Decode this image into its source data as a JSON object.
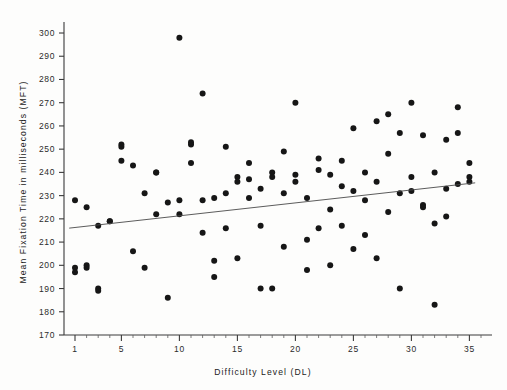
{
  "chart_data": {
    "type": "scatter",
    "title": "",
    "xlabel": "Difficulty Level (DL)",
    "ylabel": "Mean Fixation Time in milliseconds (MFT)",
    "xlim": [
      0.4,
      36.2
    ],
    "ylim": [
      170,
      303
    ],
    "xticks": [
      1,
      5,
      10,
      15,
      20,
      25,
      30,
      35
    ],
    "xtick_labels": [
      "1",
      "5",
      "10",
      "15",
      "20",
      "25",
      "30",
      "35"
    ],
    "xminor_step": 1,
    "yticks": [
      170,
      180,
      190,
      200,
      210,
      220,
      230,
      240,
      250,
      260,
      270,
      280,
      290,
      300
    ],
    "ytick_labels": [
      "170",
      "180",
      "190",
      "200",
      "210",
      "220",
      "230",
      "240",
      "250",
      "260",
      "270",
      "280",
      "290",
      "300"
    ],
    "grid": false,
    "legend": null,
    "marker": "filled-circle",
    "marker_color": "#161616",
    "marker_size": 3.0,
    "points": [
      [
        1,
        228
      ],
      [
        1,
        199
      ],
      [
        1,
        197
      ],
      [
        2,
        225
      ],
      [
        2,
        199
      ],
      [
        2,
        200
      ],
      [
        3,
        217
      ],
      [
        3,
        190
      ],
      [
        3,
        189
      ],
      [
        4,
        219
      ],
      [
        4,
        219
      ],
      [
        5,
        251
      ],
      [
        5,
        252
      ],
      [
        5,
        245
      ],
      [
        6,
        243
      ],
      [
        6,
        206
      ],
      [
        7,
        199
      ],
      [
        7,
        231
      ],
      [
        8,
        222
      ],
      [
        8,
        240
      ],
      [
        8,
        240
      ],
      [
        9,
        227
      ],
      [
        9,
        186
      ],
      [
        10,
        298
      ],
      [
        10,
        222
      ],
      [
        10,
        228
      ],
      [
        11,
        252
      ],
      [
        11,
        253
      ],
      [
        11,
        244
      ],
      [
        12,
        274
      ],
      [
        12,
        228
      ],
      [
        12,
        214
      ],
      [
        13,
        229
      ],
      [
        13,
        202
      ],
      [
        13,
        195
      ],
      [
        14,
        251
      ],
      [
        14,
        216
      ],
      [
        14,
        231
      ],
      [
        15,
        238
      ],
      [
        15,
        236
      ],
      [
        15,
        203
      ],
      [
        16,
        244
      ],
      [
        16,
        237
      ],
      [
        16,
        229
      ],
      [
        17,
        233
      ],
      [
        17,
        217
      ],
      [
        17,
        190
      ],
      [
        18,
        240
      ],
      [
        18,
        238
      ],
      [
        18,
        190
      ],
      [
        19,
        249
      ],
      [
        19,
        231
      ],
      [
        19,
        208
      ],
      [
        20,
        270
      ],
      [
        20,
        236
      ],
      [
        20,
        239
      ],
      [
        21,
        229
      ],
      [
        21,
        211
      ],
      [
        21,
        198
      ],
      [
        22,
        241
      ],
      [
        22,
        246
      ],
      [
        22,
        216
      ],
      [
        23,
        224
      ],
      [
        23,
        239
      ],
      [
        23,
        200
      ],
      [
        24,
        234
      ],
      [
        24,
        245
      ],
      [
        24,
        217
      ],
      [
        25,
        259
      ],
      [
        25,
        232
      ],
      [
        25,
        207
      ],
      [
        26,
        240
      ],
      [
        26,
        228
      ],
      [
        26,
        213
      ],
      [
        27,
        262
      ],
      [
        27,
        236
      ],
      [
        27,
        203
      ],
      [
        28,
        265
      ],
      [
        28,
        248
      ],
      [
        28,
        223
      ],
      [
        29,
        257
      ],
      [
        29,
        231
      ],
      [
        29,
        190
      ],
      [
        30,
        270
      ],
      [
        30,
        238
      ],
      [
        30,
        232
      ],
      [
        31,
        256
      ],
      [
        31,
        226
      ],
      [
        31,
        225
      ],
      [
        32,
        240
      ],
      [
        32,
        218
      ],
      [
        32,
        183
      ],
      [
        33,
        254
      ],
      [
        33,
        233
      ],
      [
        33,
        221
      ],
      [
        34,
        268
      ],
      [
        34,
        257
      ],
      [
        34,
        235
      ],
      [
        35,
        244
      ],
      [
        35,
        238
      ],
      [
        35,
        236
      ]
    ],
    "regression_line": {
      "x_start": 0.5,
      "y_start": 216.0,
      "x_end": 35.5,
      "y_end": 235.5,
      "color": "#4a4a4a",
      "description": "least-squares trend line"
    }
  }
}
